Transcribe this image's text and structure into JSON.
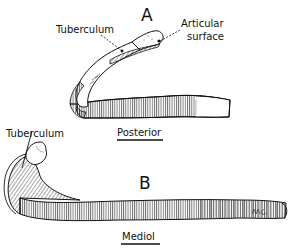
{
  "figure": {
    "panel_a": {
      "letter": "A",
      "labels": {
        "tuberculum": "Tuberculum",
        "articular_line1": "Articular",
        "articular_line2": "surface"
      },
      "view": "Posterior"
    },
    "panel_b": {
      "letter": "B",
      "labels": {
        "tuberculum": "Tuberculum"
      },
      "view": "Mediol"
    },
    "signature": "MC"
  },
  "colors": {
    "ink": "#111111",
    "background": "#ffffff"
  }
}
